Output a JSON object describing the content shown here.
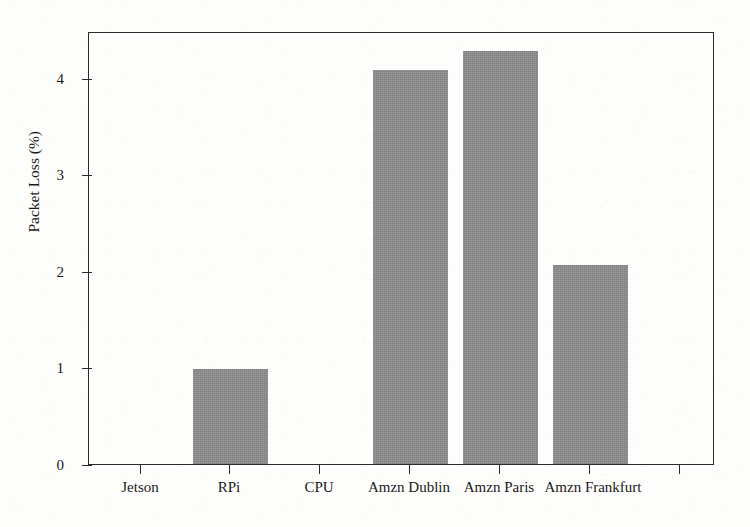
{
  "chart_data": {
    "type": "bar",
    "title": "",
    "xlabel": "",
    "ylabel": "Packet Loss (%)",
    "categories": [
      "Jetson",
      "RPi",
      "CPU",
      "Amzn Dublin",
      "Amzn Paris",
      "Amzn Frankfurt"
    ],
    "values": [
      0,
      0.99,
      0,
      4.09,
      4.28,
      2.07
    ],
    "ylim": [
      0,
      4.48
    ],
    "yticks": [
      0,
      1,
      2,
      3,
      4
    ],
    "ytick_labels": [
      "0",
      "1",
      "2",
      "3",
      "4"
    ],
    "grid": false,
    "legend": null,
    "bar_color": "#8c8c8c",
    "axis_color": "#2b2b2b"
  },
  "figure": {
    "background_color": "#fdfdfb"
  }
}
